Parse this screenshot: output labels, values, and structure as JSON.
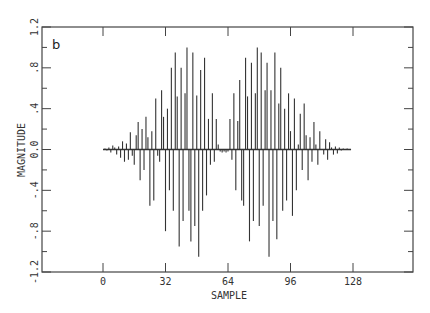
{
  "chart_data": {
    "type": "bar",
    "subtype": "stem",
    "panel_label": "b",
    "title": "",
    "xlabel": "SAMPLE",
    "ylabel": "MAGNITUDE",
    "xlim": [
      -52,
      160
    ],
    "ylim": [
      -1.2,
      1.2
    ],
    "x_ticks": [
      0,
      32,
      64,
      96,
      128
    ],
    "x_tick_labels": [
      "0",
      "32",
      "64",
      "96",
      "128"
    ],
    "y_ticks": [
      -1.2,
      -0.8,
      -0.4,
      0.0,
      0.4,
      0.8,
      1.2
    ],
    "y_tick_labels": [
      "-1.2",
      "-.8",
      "-.4",
      "0.0",
      ".4",
      ".8",
      "1.2"
    ],
    "y_minor_ticks": [
      -1.0,
      -0.6,
      -0.2,
      0.2,
      0.6,
      1.0
    ],
    "grid": false,
    "legend": null,
    "x": [
      0,
      1,
      2,
      3,
      4,
      5,
      6,
      7,
      8,
      9,
      10,
      11,
      12,
      13,
      14,
      15,
      16,
      17,
      18,
      19,
      20,
      21,
      22,
      23,
      24,
      25,
      26,
      27,
      28,
      29,
      30,
      31,
      32,
      33,
      34,
      35,
      36,
      37,
      38,
      39,
      40,
      41,
      42,
      43,
      44,
      45,
      46,
      47,
      48,
      49,
      50,
      51,
      52,
      53,
      54,
      55,
      56,
      57,
      58,
      59,
      60,
      61,
      62,
      63,
      64,
      65,
      66,
      67,
      68,
      69,
      70,
      71,
      72,
      73,
      74,
      75,
      76,
      77,
      78,
      79,
      80,
      81,
      82,
      83,
      84,
      85,
      86,
      87,
      88,
      89,
      90,
      91,
      92,
      93,
      94,
      95,
      96,
      97,
      98,
      99,
      100,
      101,
      102,
      103,
      104,
      105,
      106,
      107,
      108,
      109,
      110,
      111,
      112,
      113,
      114,
      115,
      116,
      117,
      118,
      119,
      120,
      121,
      122,
      123,
      124,
      125,
      126,
      127
    ],
    "values": [
      0.0,
      0.01,
      -0.01,
      0.02,
      -0.03,
      0.04,
      0.02,
      -0.05,
      0.03,
      -0.08,
      0.08,
      -0.12,
      0.06,
      -0.1,
      0.17,
      -0.06,
      -0.15,
      0.14,
      0.27,
      -0.3,
      0.2,
      -0.2,
      0.32,
      0.12,
      -0.55,
      0.18,
      -0.5,
      0.5,
      -0.06,
      -0.12,
      0.58,
      0.32,
      -0.8,
      0.4,
      -0.4,
      0.8,
      -0.6,
      0.95,
      0.52,
      -0.95,
      0.8,
      -0.7,
      0.55,
      1.0,
      -0.6,
      -0.9,
      0.95,
      -0.75,
      0.53,
      -1.05,
      0.78,
      -0.6,
      0.9,
      -0.45,
      0.3,
      -0.15,
      0.55,
      -0.12,
      0.3,
      0.05,
      -0.02,
      -0.03,
      -0.02,
      -0.03,
      -0.02,
      0.3,
      -0.1,
      0.55,
      -0.4,
      0.28,
      0.68,
      -0.5,
      -0.55,
      0.9,
      0.52,
      -0.9,
      0.85,
      -0.7,
      0.55,
      1.0,
      -0.75,
      0.95,
      -0.55,
      0.58,
      0.85,
      -1.05,
      0.58,
      -0.7,
      0.95,
      -0.88,
      0.45,
      0.8,
      -0.6,
      0.4,
      -0.5,
      0.55,
      0.18,
      -0.65,
      0.5,
      -0.4,
      0.05,
      0.35,
      -0.2,
      0.45,
      0.14,
      -0.3,
      0.12,
      -0.12,
      0.27,
      0.05,
      -0.15,
      0.18,
      0.0,
      -0.05,
      0.1,
      -0.1,
      0.07,
      0.02,
      -0.05,
      0.03,
      -0.04,
      0.02,
      -0.01,
      0.01,
      0.0,
      0.01,
      0.0,
      0.0
    ]
  }
}
